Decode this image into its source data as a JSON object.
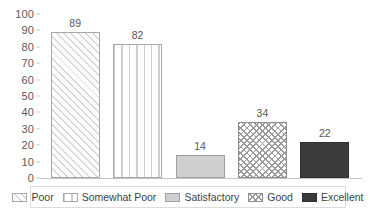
{
  "chart_data": {
    "type": "bar",
    "title": "",
    "xlabel": "",
    "ylabel": "",
    "categories": [
      "Poor",
      "Somewhat Poor",
      "Satisfactory",
      "Good",
      "Excellent"
    ],
    "values": [
      89,
      82,
      14,
      34,
      22
    ],
    "ylim": [
      0,
      100
    ],
    "ytick_step": 10,
    "yticks": [
      "100",
      "90",
      "80",
      "70",
      "60",
      "50",
      "40",
      "30",
      "20",
      "10",
      "0"
    ],
    "ytick_values": [
      100,
      90,
      80,
      70,
      60,
      50,
      40,
      30,
      20,
      10,
      0
    ],
    "data_labels": [
      "89",
      "82",
      "14",
      "34",
      "22"
    ],
    "grid": false,
    "legend_position": "bottom",
    "series": [
      {
        "name": "Responses",
        "values": [
          89,
          82,
          14,
          34,
          22
        ],
        "points": [
          {
            "category": "Poor",
            "value": 89,
            "label": "89",
            "pattern": "diagonal-hatch",
            "fill": "#ffffff",
            "stroke": "#a8a8a8"
          },
          {
            "category": "Somewhat Poor",
            "value": 82,
            "label": "82",
            "pattern": "vertical-stripes",
            "fill": "#ffffff",
            "stroke": "#a8a8a8"
          },
          {
            "category": "Satisfactory",
            "value": 14,
            "label": "14",
            "pattern": "solid",
            "fill": "#cfcfcf",
            "stroke": "#a0a0a0"
          },
          {
            "category": "Good",
            "value": 34,
            "label": "34",
            "pattern": "diamond-crosshatch",
            "fill": "#ffffff",
            "stroke": "#8f8f8f"
          },
          {
            "category": "Excellent",
            "value": 22,
            "label": "22",
            "pattern": "solid",
            "fill": "#3b3b3b",
            "stroke": "#2e2e2e"
          }
        ]
      }
    ],
    "legend": [
      {
        "label": "Poor",
        "pattern": "diagonal-hatch"
      },
      {
        "label": "Somewhat Poor",
        "pattern": "vertical-stripes"
      },
      {
        "label": "Satisfactory",
        "pattern": "solid-light"
      },
      {
        "label": "Good",
        "pattern": "diamond-crosshatch"
      },
      {
        "label": "Excellent",
        "pattern": "solid-dark"
      }
    ],
    "colors": {
      "axis": "#c4c4c4",
      "tick_label": "#5a5a5a",
      "data_label": "#585858",
      "legend_border": "#dcdcdc",
      "legend_text": "#3f3f3f",
      "background": "#ffffff"
    }
  }
}
